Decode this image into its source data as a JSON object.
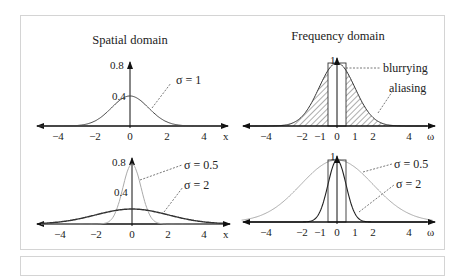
{
  "figure": {
    "left_title": "Spatial domain",
    "right_title": "Frequency domain",
    "panels": {
      "spatial_top": {
        "x_ticks": [
          "−4",
          "−2",
          "0",
          "2",
          "4"
        ],
        "x_label": "x",
        "y_ticks": [
          "0.8",
          "0.4"
        ],
        "curve_label": "σ = 1"
      },
      "spatial_bottom": {
        "x_ticks": [
          "−4",
          "−2",
          "0",
          "2",
          "4"
        ],
        "x_label": "x",
        "y_ticks": [
          "0.8",
          "0.4"
        ],
        "curve_labels": [
          "σ = 0.5",
          "σ = 2"
        ]
      },
      "freq_top": {
        "x_ticks": [
          "−4",
          "−2",
          "−1",
          "0",
          "1",
          "2",
          "4"
        ],
        "x_label": "ω",
        "y_tick": "1",
        "annotations": [
          "blurrying",
          "aliasing"
        ]
      },
      "freq_bottom": {
        "x_ticks": [
          "−4",
          "−2",
          "−1",
          "0",
          "1",
          "2",
          "4"
        ],
        "x_label": "ω",
        "y_tick": "1",
        "curve_labels": [
          "σ = 0.5",
          "σ = 2"
        ]
      }
    }
  },
  "chart_data": [
    {
      "type": "line",
      "title": "Spatial domain",
      "series": [
        {
          "name": "σ = 1",
          "function": "gaussian",
          "sigma": 1,
          "peak": 0.4
        }
      ],
      "xlabel": "x",
      "xlim": [
        -5,
        5
      ],
      "ylim": [
        0,
        0.8
      ]
    },
    {
      "type": "line",
      "title": "Spatial domain",
      "series": [
        {
          "name": "σ = 0.5",
          "function": "gaussian",
          "sigma": 0.5,
          "peak": 0.8
        },
        {
          "name": "σ = 2",
          "function": "gaussian",
          "sigma": 2,
          "peak": 0.2
        }
      ],
      "xlabel": "x",
      "xlim": [
        -5,
        5
      ],
      "ylim": [
        0,
        0.8
      ]
    },
    {
      "type": "area",
      "title": "Frequency domain",
      "series": [
        {
          "name": "σ = 1",
          "function": "gaussian",
          "peak": 1
        }
      ],
      "annotations": [
        "blurrying",
        "aliasing"
      ],
      "box": [
        -0.5,
        0.5
      ],
      "xlabel": "ω",
      "xlim": [
        -5,
        5
      ],
      "ylim": [
        0,
        1
      ]
    },
    {
      "type": "line",
      "title": "Frequency domain",
      "series": [
        {
          "name": "σ = 0.5",
          "function": "gaussian",
          "peak": 1,
          "wide": true
        },
        {
          "name": "σ = 2",
          "function": "gaussian",
          "peak": 1,
          "wide": false
        }
      ],
      "box": [
        -0.5,
        0.5
      ],
      "xlabel": "ω",
      "xlim": [
        -5,
        5
      ],
      "ylim": [
        0,
        1
      ]
    }
  ]
}
